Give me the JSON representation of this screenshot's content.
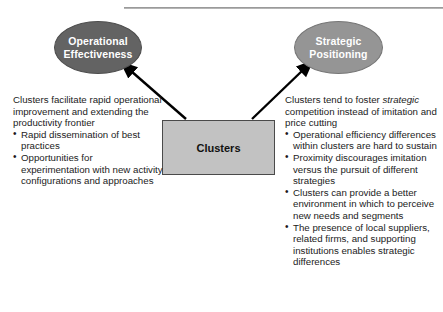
{
  "figure": {
    "nodes": {
      "left_ellipse": {
        "label_line1": "Operational",
        "label_line2": "Effectiveness",
        "fill": "#636363",
        "text_color": "#ffffff"
      },
      "right_ellipse": {
        "label_line1": "Strategic",
        "label_line2": "Positioning",
        "fill": "#959595",
        "text_color": "#ffffff"
      },
      "center_box": {
        "label": "Clusters",
        "fill": "#c2c2c2",
        "border": "#4a4a4a"
      }
    },
    "arrows": {
      "left_arrow_name": "arrow-clusters-to-operational-effectiveness",
      "right_arrow_name": "arrow-clusters-to-strategic-positioning",
      "color": "#000000"
    },
    "left_column": {
      "intro": "Clusters facilitate rapid operational improvement and extending the productivity frontier",
      "bullets": [
        "Rapid dissemination of best practices",
        "Opportunities for experimentation with new activity configurations and approaches"
      ]
    },
    "right_column": {
      "intro_before_italic": "Clusters tend to foster ",
      "intro_italic": "strategic",
      "intro_after_italic": " competition instead of imitation and price cutting",
      "bullets": [
        "Operational efficiency differences within clusters are hard to sustain",
        "Proximity discourages imitation versus the pursuit of different strategies",
        "Clusters can provide a better environment in which to perceive new needs and segments",
        "The presence of local suppliers, related firms, and supporting institutions enables strategic differences"
      ]
    }
  }
}
